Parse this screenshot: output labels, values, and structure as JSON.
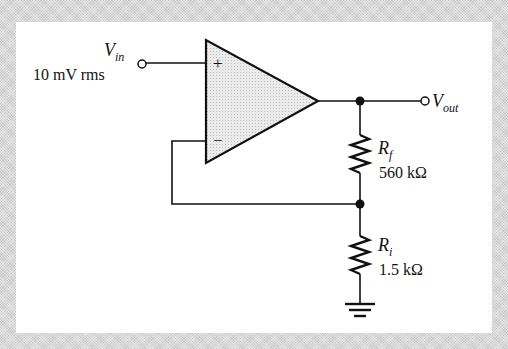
{
  "diagram": {
    "type": "non-inverting op-amp amplifier",
    "colors": {
      "background": "#d9d9d9",
      "panel": "#ffffff",
      "wire": "#111111",
      "opamp_fill": "#e6e6e6"
    },
    "opamp": {
      "plus_symbol": "+",
      "minus_symbol": "−"
    },
    "input": {
      "label_main": "V",
      "label_sub": "in",
      "value": "10 mV rms"
    },
    "output": {
      "label_main": "V",
      "label_sub": "out"
    },
    "resistors": [
      {
        "id": "Rf",
        "label_main": "R",
        "label_sub": "f",
        "value": "560 kΩ"
      },
      {
        "id": "Ri",
        "label_main": "R",
        "label_sub": "i",
        "value": "1.5 kΩ"
      }
    ],
    "ground": {
      "icon": "ground-icon"
    }
  }
}
